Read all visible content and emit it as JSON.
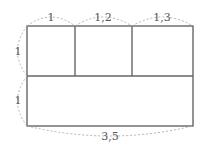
{
  "diagram": {
    "title": "",
    "colors": {
      "outline": "#666666",
      "dash": "#aaaaaa",
      "label": "#555555"
    },
    "dimensions": {
      "top": [
        "1",
        "1,2",
        "1,3"
      ],
      "left": [
        "1",
        "1"
      ],
      "bottom": "3,5"
    }
  }
}
